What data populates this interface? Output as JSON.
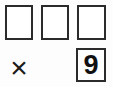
{
  "worksheet": {
    "type": "arithmetic-answer-grid",
    "background_color": "#fdfdfd",
    "ink_color": "#1a1a1a",
    "border_color": "#2b2b2b",
    "top_row": {
      "name": "empty-answer-boxes",
      "boxes": [
        {
          "label": "",
          "filled": false
        },
        {
          "label": "",
          "filled": false
        },
        {
          "label": "",
          "filled": false
        }
      ]
    },
    "bottom_row": {
      "operator": {
        "icon": "multiplication-sign-icon",
        "glyph": "×"
      },
      "digit_box": {
        "value": "9",
        "filled": true
      }
    }
  }
}
